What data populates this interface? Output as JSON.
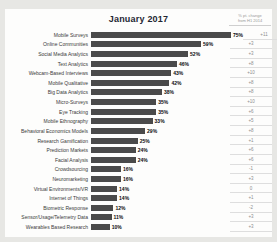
{
  "title": "January 2017",
  "change_header": {
    "line1": "% pt. change",
    "line2": "from H1 2014"
  },
  "chart_data": {
    "type": "bar",
    "orientation": "horizontal",
    "title": "January 2017",
    "xlabel": "",
    "ylabel": "",
    "xlim": [
      0,
      80
    ],
    "value_suffix": "%",
    "grid": false,
    "legend": "none",
    "bar_color": "#4a4a4a",
    "categories": [
      "Mobile Surveys",
      "Online Communities",
      "Social Media Analytics",
      "Text Analytics",
      "Webcam-Based Interviews",
      "Mobile Qualitative",
      "Big Data Analytics",
      "Micro-Surveys",
      "Eye Tracking",
      "Mobile Ethnography",
      "Behavioral Economics Models",
      "Research Gamification",
      "Prediction Markets",
      "Facial Analysis",
      "Crowdsourcing",
      "Neuromarketing",
      "Virtual Environments/VR",
      "Internet of Things",
      "Biometric Response",
      "Sensor/Usage/Telemetry Data",
      "Wearables Based Research"
    ],
    "values": [
      75,
      59,
      52,
      46,
      43,
      42,
      38,
      35,
      35,
      33,
      29,
      25,
      24,
      24,
      16,
      16,
      14,
      14,
      12,
      11,
      10
    ],
    "value_labels": [
      "75%",
      "59%",
      "52%",
      "46%",
      "43%",
      "42%",
      "38%",
      "35%",
      "35%",
      "33%",
      "29%",
      "25%",
      "24%",
      "24%",
      "16%",
      "16%",
      "14%",
      "14%",
      "12%",
      "11%",
      "10%"
    ],
    "change_from_h1_2014": [
      "+11",
      "+3",
      "+3",
      "+8",
      "+10",
      "+8",
      "+8",
      "+10",
      "+6",
      "+5",
      "+8",
      "+1",
      "+6",
      "+6",
      "-1",
      "+3",
      "0",
      "+1",
      "-2",
      "+3",
      "+3"
    ]
  }
}
